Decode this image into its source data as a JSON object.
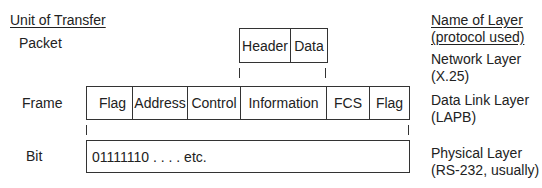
{
  "left_header": "Unit of Transfer",
  "right_header": [
    "Name of Layer",
    "(protocol used)"
  ],
  "units": {
    "packet": "Packet",
    "frame": "Frame",
    "bit": "Bit"
  },
  "packet_fields": [
    "Header",
    "Data"
  ],
  "frame_fields": [
    "Flag",
    "Address",
    "Control",
    "Information",
    "FCS",
    "Flag"
  ],
  "bit_content": "01111110 . . . . etc.",
  "layers": [
    {
      "name": "Network Layer",
      "protocol": "(X.25)"
    },
    {
      "name": "Data Link Layer",
      "protocol": "(LAPB)"
    },
    {
      "name": "Physical Layer",
      "protocol": "(RS-232, usually)"
    }
  ]
}
